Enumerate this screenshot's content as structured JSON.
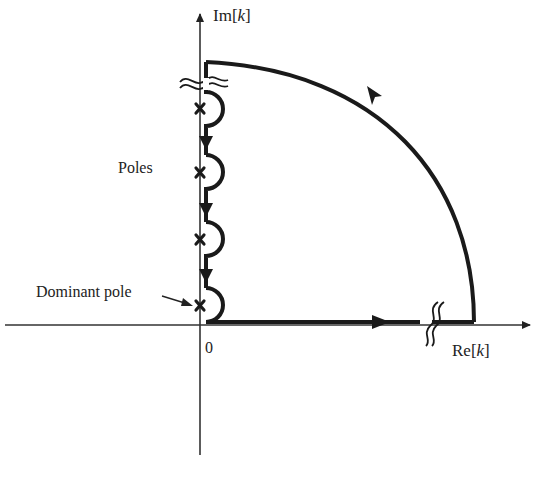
{
  "diagram": {
    "type": "contour-integration-complex-plane",
    "axes": {
      "vertical_label_prefix": "Im[",
      "vertical_label_var": "k",
      "vertical_label_suffix": "]",
      "horizontal_label_prefix": "Re[",
      "horizontal_label_var": "k",
      "horizontal_label_suffix": "]",
      "origin_label": "0"
    },
    "annotations": {
      "poles_label": "Poles",
      "dominant_pole_label": "Dominant pole"
    },
    "poles": [
      {
        "id": 1,
        "position": "upper"
      },
      {
        "id": 2,
        "position": "mid-upper"
      },
      {
        "id": 3,
        "position": "mid-lower"
      },
      {
        "id": 4,
        "position": "dominant",
        "dominant": true
      }
    ],
    "contour": {
      "segments": [
        "positive real axis (to the right)",
        "quarter arc at infinity (counter-clockwise)",
        "down the imaginary axis with semicircular indentations around poles"
      ],
      "break_marks": [
        "on real axis near infinity",
        "on imaginary axis near infinity"
      ]
    },
    "colors": {
      "line": "#1a1a1a",
      "axis": "#333333",
      "background": "#ffffff"
    }
  }
}
